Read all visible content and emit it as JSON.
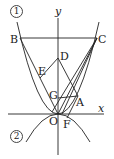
{
  "figure": {
    "curve1_label": "1",
    "curve2_label": "2",
    "axis_x_label": "x",
    "axis_y_label": "y",
    "points": {
      "A": "A",
      "B": "B",
      "C": "C",
      "D": "D",
      "E": "E",
      "F": "F",
      "G": "G",
      "O": "O"
    },
    "line_color": "#222222"
  }
}
